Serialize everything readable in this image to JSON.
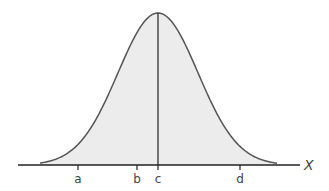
{
  "diagram": {
    "type": "normal-distribution-curve",
    "axis_label": "X",
    "ticks": [
      {
        "label": "a",
        "x": 78
      },
      {
        "label": "b",
        "x": 137
      },
      {
        "label": "c",
        "x": 158
      },
      {
        "label": "d",
        "x": 240
      }
    ],
    "mean_line_label": "c",
    "colors": {
      "fill": "#ececec",
      "stroke": "#555555",
      "axis": "#222222"
    }
  }
}
